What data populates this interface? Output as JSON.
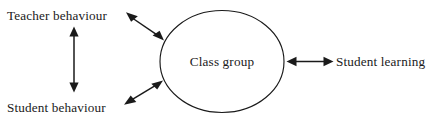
{
  "diagram": {
    "type": "concept-map",
    "background_color": "#ffffff",
    "stroke_color": "#1a1a1a",
    "text_color": "#1a1a1a",
    "central_node": {
      "label": "Class group",
      "shape": "ellipse",
      "cx": 222,
      "cy": 61.5,
      "rx": 62,
      "ry": 51
    },
    "labels": [
      {
        "id": "teacher-behaviour",
        "text": "Teacher behaviour",
        "x": 7,
        "y": 20,
        "anchor": "start"
      },
      {
        "id": "student-behaviour",
        "text": "Student behaviour",
        "x": 7,
        "y": 112,
        "anchor": "start"
      },
      {
        "id": "student-learning",
        "text": "Student learning",
        "x": 336,
        "y": 66,
        "anchor": "start"
      }
    ],
    "connectors": [
      {
        "id": "teacher-behaviour-to-class-group",
        "from": "teacher-behaviour",
        "to": "class-group",
        "direction": "bidirectional",
        "x1": 128,
        "y1": 15,
        "x2": 162,
        "y2": 38
      },
      {
        "id": "student-behaviour-to-class-group",
        "from": "student-behaviour",
        "to": "class-group",
        "direction": "bidirectional",
        "x1": 127,
        "y1": 103,
        "x2": 161,
        "y2": 82
      },
      {
        "id": "teacher-behaviour-to-student-behaviour",
        "from": "teacher-behaviour",
        "to": "student-behaviour",
        "direction": "bidirectional",
        "x1": 74,
        "y1": 28,
        "x2": 74,
        "y2": 91
      },
      {
        "id": "class-group-to-student-learning",
        "from": "class-group",
        "to": "student-learning",
        "direction": "bidirectional",
        "x1": 287,
        "y1": 61.5,
        "x2": 333,
        "y2": 61.5
      }
    ]
  }
}
